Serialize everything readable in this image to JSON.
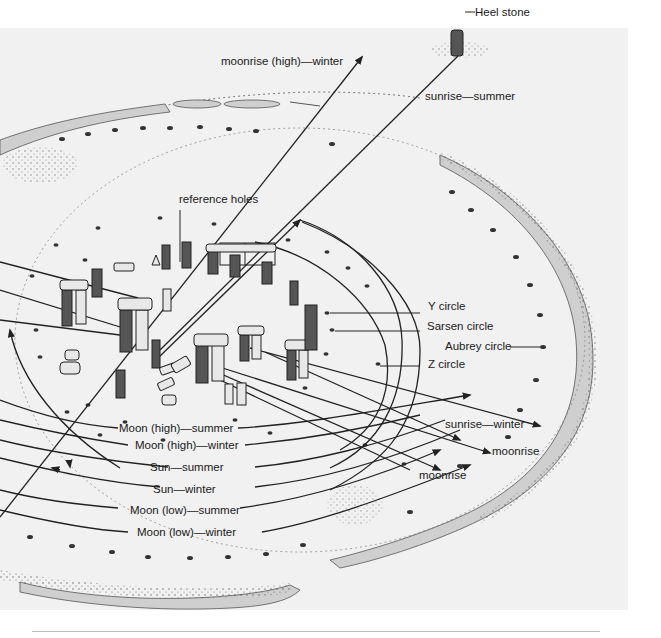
{
  "figure": {
    "background_color": "#f1f1f1",
    "ink_color": "#1a1a1a",
    "bank_fill_color": "#cfcfcf"
  },
  "labels": {
    "heel_stone": "Heel stone",
    "moonrise_high_winter": "moonrise (high)—winter",
    "sunrise_summer": "sunrise—summer",
    "reference_holes": "reference holes",
    "y_circle": "Y circle",
    "sarsen_circle": "Sarsen circle",
    "aubrey_circle": "Aubrey circle",
    "z_circle": "Z circle",
    "sunrise_winter": "sunrise—winter",
    "moonrise_right": "moonrise",
    "moonrise_lower": "moonrise",
    "arcs": [
      "Moon (high)—summer",
      "Moon (high)—winter",
      "Sun—summer",
      "Sun—winter",
      "Moon (low)—summer",
      "Moon (low)—winter"
    ]
  }
}
